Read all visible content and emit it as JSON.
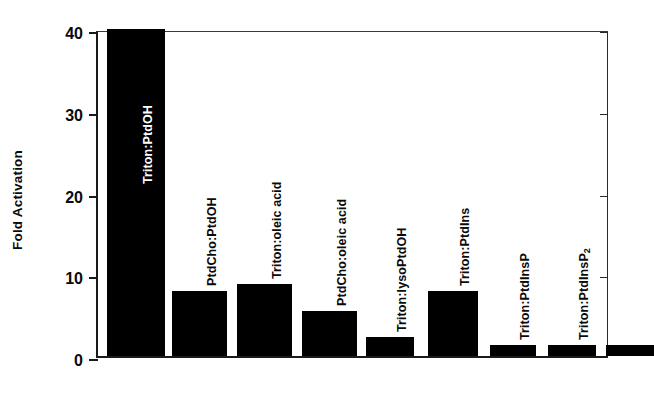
{
  "chart_data": {
    "type": "bar",
    "title": "",
    "xlabel": "",
    "ylabel": "Fold Activation",
    "ylim": [
      0,
      40
    ],
    "yticks": [
      0,
      10,
      20,
      30,
      40
    ],
    "ytick_labels": [
      "0",
      "10",
      "20",
      "30",
      "40"
    ],
    "grid": false,
    "legend": "none",
    "bar_color": "#000000",
    "categories": [
      "Triton:PtdOH",
      "PtdCho:PtdOH",
      "Triton:oleic acid",
      "PtdCho:oleic acid",
      "Triton:lysoPtdOH",
      "Triton:PtdIns",
      "Triton:PtdInsP",
      "Triton:PtdInsP2",
      ""
    ],
    "values": [
      40,
      8.0,
      8.8,
      5.5,
      2.3,
      8.0,
      1.35,
      1.35,
      1.35
    ],
    "bars": [
      {
        "label": "Triton:PtdOH",
        "label_html": "Triton:PtdOH",
        "value": 40,
        "label_inside": true,
        "left": 9,
        "width": 58
      },
      {
        "label": "PtdCho:PtdOH",
        "label_html": "PtdCho:PtdOH",
        "value": 8.0,
        "label_inside": false,
        "left": 74,
        "width": 55
      },
      {
        "label": "Triton:oleic acid",
        "label_html": "Triton:oleic acid",
        "value": 8.8,
        "label_inside": false,
        "left": 139,
        "width": 55
      },
      {
        "label": "PtdCho:oleic acid",
        "label_html": "PtdCho:oleic acid",
        "value": 5.5,
        "label_inside": false,
        "left": 204,
        "width": 55
      },
      {
        "label": "Triton:lysoPtdOH",
        "label_html": "Triton:lysoPtdOH",
        "value": 2.3,
        "label_inside": false,
        "left": 268,
        "width": 48
      },
      {
        "label": "Triton:PtdIns",
        "label_html": "Triton:PtdIns",
        "value": 8.0,
        "label_inside": false,
        "left": 330,
        "width": 50
      },
      {
        "label": "Triton:PtdInsP",
        "label_html": "Triton:PtdInsP",
        "value": 1.35,
        "label_inside": false,
        "left": 392,
        "width": 46
      },
      {
        "label": "Triton:PtdInsP2",
        "label_html": "Triton:PtdInsP<sub>2</sub>",
        "value": 1.35,
        "label_inside": false,
        "left": 450,
        "width": 48
      },
      {
        "label": "",
        "label_html": "",
        "value": 1.35,
        "label_inside": false,
        "left": 508,
        "width": 48
      }
    ]
  },
  "axis": {
    "ylabel": "Fold Activation"
  }
}
